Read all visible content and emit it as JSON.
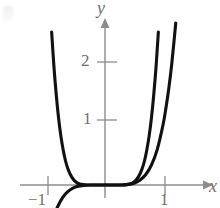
{
  "figure": {
    "background": "#ffffff",
    "axis_color": "#8c8c8c",
    "curve_color": "#111111",
    "label_color": "#6e6e6e"
  },
  "axes": {
    "x_label": "x",
    "y_label": "y",
    "x_ticks": [
      {
        "value": -1,
        "label": "−1"
      },
      {
        "value": 1,
        "label": "1"
      }
    ],
    "y_ticks": [
      {
        "value": 1,
        "label": "1"
      },
      {
        "value": 2,
        "label": "2"
      }
    ],
    "xlim": [
      -1.35,
      1.75
    ],
    "ylim": [
      -0.4,
      2.9
    ],
    "origin_px": {
      "x": 105,
      "y": 185
    },
    "unit_px": {
      "x": 58,
      "y": 60
    },
    "grid": false,
    "arrows": [
      "x-positive",
      "y-positive"
    ]
  },
  "chart_data": {
    "type": "line",
    "title": "",
    "xlabel": "x",
    "ylabel": "y",
    "grid": false,
    "legend": "none",
    "xlim": [
      -1.35,
      1.75
    ],
    "ylim": [
      -0.4,
      2.9
    ],
    "series": [
      {
        "name": "even-power-curve",
        "expression": "y = x^8",
        "comment": "steep even curve, symmetric about the y-axis, flat near origin",
        "points": [
          [
            -0.92,
            2.55
          ],
          [
            -0.88,
            1.97
          ],
          [
            -0.84,
            1.5
          ],
          [
            -0.8,
            1.11
          ],
          [
            -0.76,
            0.81
          ],
          [
            -0.72,
            0.58
          ],
          [
            -0.68,
            0.4
          ],
          [
            -0.64,
            0.27
          ],
          [
            -0.6,
            0.18
          ],
          [
            -0.55,
            0.1
          ],
          [
            -0.5,
            0.05
          ],
          [
            -0.45,
            0.02
          ],
          [
            -0.4,
            0.01
          ],
          [
            -0.3,
            0.0
          ],
          [
            -0.2,
            0.0
          ],
          [
            -0.1,
            0.0
          ],
          [
            0.0,
            0.0
          ],
          [
            0.1,
            0.0
          ],
          [
            0.2,
            0.0
          ],
          [
            0.3,
            0.0
          ],
          [
            0.4,
            0.01
          ],
          [
            0.45,
            0.02
          ],
          [
            0.5,
            0.05
          ],
          [
            0.55,
            0.1
          ],
          [
            0.6,
            0.18
          ],
          [
            0.64,
            0.27
          ],
          [
            0.68,
            0.4
          ],
          [
            0.72,
            0.58
          ],
          [
            0.76,
            0.81
          ],
          [
            0.8,
            1.11
          ],
          [
            0.84,
            1.5
          ],
          [
            0.88,
            1.97
          ],
          [
            0.92,
            2.55
          ]
        ]
      },
      {
        "name": "odd-power-curve",
        "expression": "y = x^5",
        "comment": "odd curve through origin, dips below axis for x<0",
        "points": [
          [
            -1.22,
            -2.7
          ],
          [
            -1.15,
            -2.01
          ],
          [
            -1.1,
            -1.61
          ],
          [
            -1.05,
            -1.28
          ],
          [
            -1.0,
            -1.0
          ],
          [
            -0.95,
            -0.77
          ],
          [
            -0.9,
            -0.59
          ],
          [
            -0.85,
            -0.44
          ],
          [
            -0.8,
            -0.33
          ],
          [
            -0.75,
            -0.24
          ],
          [
            -0.7,
            -0.17
          ],
          [
            -0.65,
            -0.12
          ],
          [
            -0.6,
            -0.08
          ],
          [
            -0.5,
            -0.03
          ],
          [
            -0.4,
            -0.01
          ],
          [
            -0.25,
            0.0
          ],
          [
            0.0,
            0.0
          ],
          [
            0.25,
            0.0
          ],
          [
            0.4,
            0.01
          ],
          [
            0.5,
            0.03
          ],
          [
            0.6,
            0.08
          ],
          [
            0.7,
            0.17
          ],
          [
            0.8,
            0.33
          ],
          [
            0.9,
            0.59
          ],
          [
            1.0,
            1.0
          ],
          [
            1.05,
            1.28
          ],
          [
            1.1,
            1.61
          ],
          [
            1.15,
            2.01
          ],
          [
            1.22,
            2.7
          ]
        ]
      }
    ]
  }
}
